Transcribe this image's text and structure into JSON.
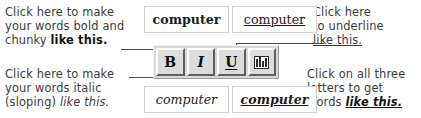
{
  "annotations": {
    "bold": {
      "name": "bold-callout",
      "line1": "Click here to make",
      "line2": "your words bold and",
      "line3_plain": "chunky ",
      "line3_emph": "like this."
    },
    "italic": {
      "name": "italic-callout",
      "line1": "Click here to make",
      "line2": "your words italic",
      "line3_plain": "(sloping) ",
      "line3_emph": "like this."
    },
    "underline": {
      "name": "underline-callout",
      "line1": "Click here",
      "line2": "to underline",
      "line3_emph": "like this."
    },
    "all_three": {
      "name": "all-three-callout",
      "line1": "Click on all three",
      "line2": "letters to get",
      "line3_plain": "words ",
      "line3_emph": "like this."
    }
  },
  "samples": {
    "bold": {
      "text": "computer",
      "style": "bold"
    },
    "underline": {
      "text": "computer",
      "style": "underline"
    },
    "italic": {
      "text": "computer",
      "style": "italic"
    },
    "all_three": {
      "text": "computer",
      "style": "bold italic underline"
    }
  },
  "toolbar": {
    "buttons": [
      {
        "label": "B",
        "name": "bold-button",
        "title": "Bold"
      },
      {
        "label": "I",
        "name": "italic-button",
        "title": "Italic"
      },
      {
        "label": "U",
        "name": "underline-button",
        "title": "Underline"
      },
      {
        "label": "",
        "name": "highlight-button",
        "title": "Highlight"
      }
    ]
  },
  "colors": {
    "ink": "#3a3a3a",
    "toolbar_face": "#d8d8d8",
    "button_face": "#dcdcdc",
    "button_light": "#ffffff",
    "button_shadow": "#5e5e5e",
    "sample_border": "#d2d2d2",
    "leader_line": "#4a4a4a"
  }
}
